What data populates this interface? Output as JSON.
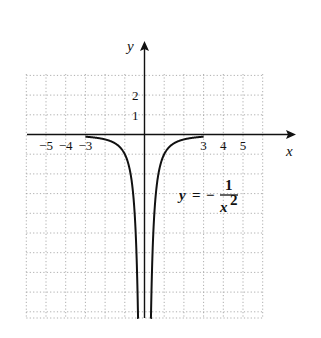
{
  "chart_data": {
    "type": "line",
    "title": "",
    "equation": {
      "lhs": "y",
      "eq": "=",
      "sign": "−",
      "num": "1",
      "den": "x",
      "exp": "2"
    },
    "xlabel": "x",
    "ylabel": "y",
    "xlim": [
      -6,
      6
    ],
    "ylim": [
      -9,
      3
    ],
    "grid": true,
    "x_ticks": [
      {
        "v": -5,
        "label": "−5"
      },
      {
        "v": -4,
        "label": "−4"
      },
      {
        "v": -3,
        "label": "−3"
      },
      {
        "v": 3,
        "label": "3"
      },
      {
        "v": 4,
        "label": "4"
      },
      {
        "v": 5,
        "label": "5"
      }
    ],
    "y_ticks": [
      {
        "v": 1,
        "label": "1"
      },
      {
        "v": 2,
        "label": "2"
      }
    ],
    "series": [
      {
        "name": "y = -1/x^2",
        "domain_left": [
          -3,
          -0.33
        ],
        "domain_right": [
          0.33,
          3
        ]
      }
    ]
  }
}
